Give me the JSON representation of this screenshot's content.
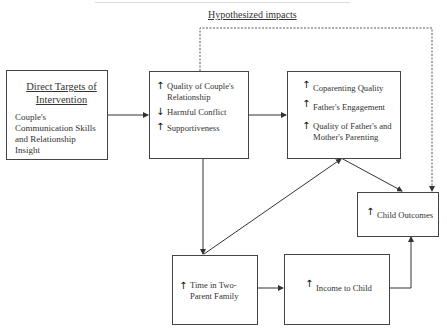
{
  "title": "Hypothesized impacts",
  "boxes": {
    "direct_targets": {
      "heading": "Direct Targets of Intervention",
      "text": "Couple's Communication Skills and Relationship Insight"
    },
    "couple_relationship": {
      "items": [
        {
          "icon": "up-arrow-icon",
          "glyph": "↑",
          "label": "Quality of Couple's Relationship"
        },
        {
          "icon": "down-arrow-icon",
          "glyph": "↓",
          "label": "Harmful Conflict"
        },
        {
          "icon": "up-arrow-icon",
          "glyph": "↑",
          "label": "Supportiveness"
        }
      ]
    },
    "parenting": {
      "items": [
        {
          "icon": "up-arrow-icon",
          "glyph": "↑",
          "label": "Coparenting Quality"
        },
        {
          "icon": "up-arrow-icon",
          "glyph": "↑",
          "label": "Father's Engagement"
        },
        {
          "icon": "up-arrow-icon",
          "glyph": "↑",
          "label": "Quality of Father's and Mother's Parenting"
        }
      ]
    },
    "child_outcomes": {
      "items": [
        {
          "icon": "up-arrow-icon",
          "glyph": "↑",
          "label": "Child Outcomes"
        }
      ]
    },
    "two_parent": {
      "items": [
        {
          "icon": "up-arrow-icon",
          "glyph": "↑",
          "label": "Time in Two-Parent Family"
        }
      ]
    },
    "income": {
      "items": [
        {
          "icon": "up-arrow-icon",
          "glyph": "↑",
          "label": "Income to Child"
        }
      ]
    }
  },
  "connections": [
    {
      "from": "direct_targets",
      "to": "couple_relationship",
      "style": "solid"
    },
    {
      "from": "couple_relationship",
      "to": "parenting",
      "style": "solid"
    },
    {
      "from": "couple_relationship",
      "to": "two_parent",
      "style": "solid"
    },
    {
      "from": "two_parent",
      "to": "parenting",
      "style": "solid"
    },
    {
      "from": "parenting",
      "to": "child_outcomes",
      "style": "solid"
    },
    {
      "from": "two_parent",
      "to": "income",
      "style": "solid"
    },
    {
      "from": "income",
      "to": "child_outcomes",
      "style": "solid"
    },
    {
      "from": "couple_relationship",
      "to": "child_outcomes",
      "style": "dashed"
    }
  ]
}
